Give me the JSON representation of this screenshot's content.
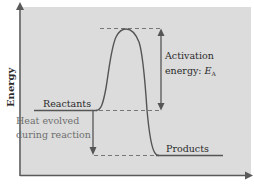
{
  "diagram": {
    "type": "reaction-energy-profile",
    "axes": {
      "y_label": "Energy",
      "x_label": ""
    },
    "labels": {
      "reactants": "Reactants",
      "products": "Products",
      "activation_line1": "Activation",
      "activation_line2": "energy: ",
      "activation_symbol": "E",
      "activation_subscript": "A",
      "heat_line1": "Heat evolved",
      "heat_line2": "during reaction"
    },
    "levels": {
      "reactants_energy": "medium",
      "transition_state_energy": "high",
      "products_energy": "low"
    },
    "colors": {
      "panel_background": "#dcdcdc",
      "curve": "#555555",
      "axis": "#5a5a5a",
      "dashed": "#777777",
      "text": "#2a2a2a",
      "heat_text": "#6e6e6e"
    }
  }
}
